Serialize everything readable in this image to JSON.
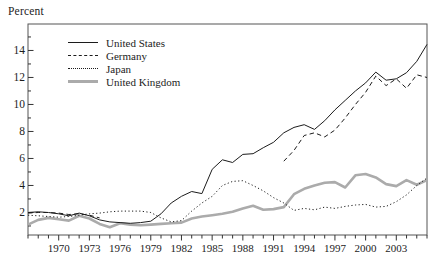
{
  "chart": {
    "corner_label": "Percent",
    "legend_position": "top-left-inside"
  },
  "chart_data": {
    "type": "line",
    "title": "",
    "ylabel": "Percent",
    "xlabel": "",
    "grid": false,
    "x_start_year": 1967,
    "x_end_year": 2006,
    "ylim": [
      0.33,
      16.0
    ],
    "y_major_ticks": [
      2,
      4,
      6,
      8,
      10,
      12,
      14
    ],
    "y_minor_ticks": [
      1,
      3,
      5,
      7,
      9,
      11,
      13,
      15
    ],
    "x_labeled_years": [
      1970,
      1973,
      1976,
      1979,
      1982,
      1985,
      1988,
      1991,
      1994,
      1997,
      2000,
      2003
    ],
    "x_tick_labels": [
      "1970",
      "1973",
      "1976",
      "1979",
      "1982",
      "1985",
      "1988",
      "1991",
      "1994",
      "1997",
      "2000",
      "2003"
    ],
    "colors": {
      "line_black": "#1c1c1c",
      "line_gray": "#ababab",
      "frame": "#555555",
      "axis": "#333333",
      "text": "#1c1c1c"
    },
    "series": [
      {
        "name": "United States",
        "style": "solid",
        "color": "#1c1c1c",
        "width": 1,
        "values": [
          2.0,
          2.05,
          2.0,
          1.9,
          1.75,
          1.95,
          1.75,
          1.45,
          1.3,
          1.25,
          1.2,
          1.25,
          1.35,
          1.9,
          2.7,
          3.2,
          3.55,
          3.4,
          5.2,
          5.9,
          5.7,
          6.3,
          6.35,
          6.8,
          7.2,
          7.9,
          8.3,
          8.5,
          8.15,
          8.8,
          9.6,
          10.3,
          11.0,
          11.6,
          12.4,
          11.8,
          11.9,
          12.35,
          13.2,
          14.45
        ]
      },
      {
        "name": "Germany",
        "style": "dashed",
        "color": "#1c1c1c",
        "width": 1,
        "values": [
          1.95,
          2.0,
          2.0,
          1.95,
          1.85,
          1.9,
          1.8,
          1.6,
          null,
          null,
          null,
          null,
          null,
          null,
          null,
          null,
          null,
          null,
          null,
          null,
          null,
          null,
          null,
          null,
          null,
          5.8,
          6.6,
          7.7,
          7.9,
          7.6,
          8.1,
          9.0,
          10.0,
          10.9,
          12.1,
          11.4,
          11.9,
          11.2,
          12.2,
          12.0
        ]
      },
      {
        "name": "Japan",
        "style": "dotted",
        "color": "#1c1c1c",
        "width": 1,
        "values": [
          1.8,
          1.75,
          1.7,
          1.65,
          1.7,
          1.8,
          1.9,
          1.95,
          2.05,
          2.1,
          2.1,
          2.1,
          2.0,
          1.6,
          1.3,
          1.4,
          2.1,
          2.7,
          3.2,
          4.0,
          4.3,
          4.35,
          4.0,
          3.6,
          3.1,
          2.7,
          2.15,
          2.3,
          2.2,
          2.4,
          2.3,
          2.45,
          2.55,
          2.6,
          2.4,
          2.45,
          2.8,
          3.3,
          4.0,
          4.55
        ]
      },
      {
        "name": "United Kingdom",
        "style": "thick-solid",
        "color": "#ababab",
        "width": 2.6,
        "values": [
          1.1,
          1.45,
          1.6,
          1.5,
          1.4,
          1.75,
          1.55,
          1.15,
          0.9,
          1.2,
          1.1,
          1.05,
          1.1,
          1.15,
          1.2,
          1.25,
          1.55,
          1.7,
          1.8,
          1.9,
          2.05,
          2.3,
          2.5,
          2.2,
          2.25,
          2.4,
          3.35,
          3.75,
          4.0,
          4.2,
          4.25,
          3.85,
          4.75,
          4.85,
          4.6,
          4.1,
          3.95,
          4.4,
          4.05,
          4.4
        ]
      }
    ]
  }
}
